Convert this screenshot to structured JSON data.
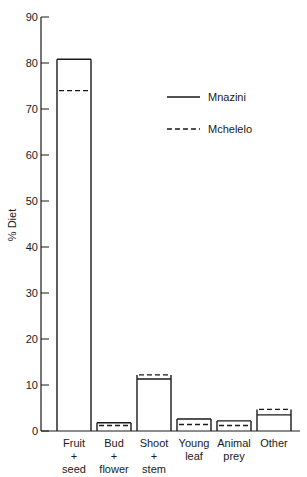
{
  "chart_data": {
    "type": "bar",
    "title": "",
    "xlabel": "",
    "ylabel": "% Diet",
    "ylim": [
      0,
      90
    ],
    "yticks": [
      0,
      10,
      20,
      30,
      40,
      50,
      60,
      70,
      80,
      90
    ],
    "grid": false,
    "legend_position": "upper right",
    "categories": [
      [
        "Fruit",
        "+",
        "seed"
      ],
      [
        "Bud",
        "+",
        "flower"
      ],
      [
        "Shoot",
        "+",
        "stem"
      ],
      [
        "Young",
        "leaf"
      ],
      [
        "Animal",
        "prey"
      ],
      [
        "Other"
      ]
    ],
    "series": [
      {
        "name": "Mnazini",
        "style": "solid",
        "values": [
          80.8,
          1.8,
          11.3,
          2.6,
          2.2,
          3.5
        ]
      },
      {
        "name": "Mchelelo",
        "style": "dashed",
        "values": [
          74.0,
          1.2,
          12.2,
          1.4,
          1.2,
          4.7
        ]
      }
    ]
  },
  "legend": {
    "items": [
      {
        "label": "Mnazini",
        "style": "solid"
      },
      {
        "label": "Mchelelo",
        "style": "dashed"
      }
    ]
  },
  "colors": {
    "line": "#1a1a1a",
    "background": "#ffffff"
  }
}
